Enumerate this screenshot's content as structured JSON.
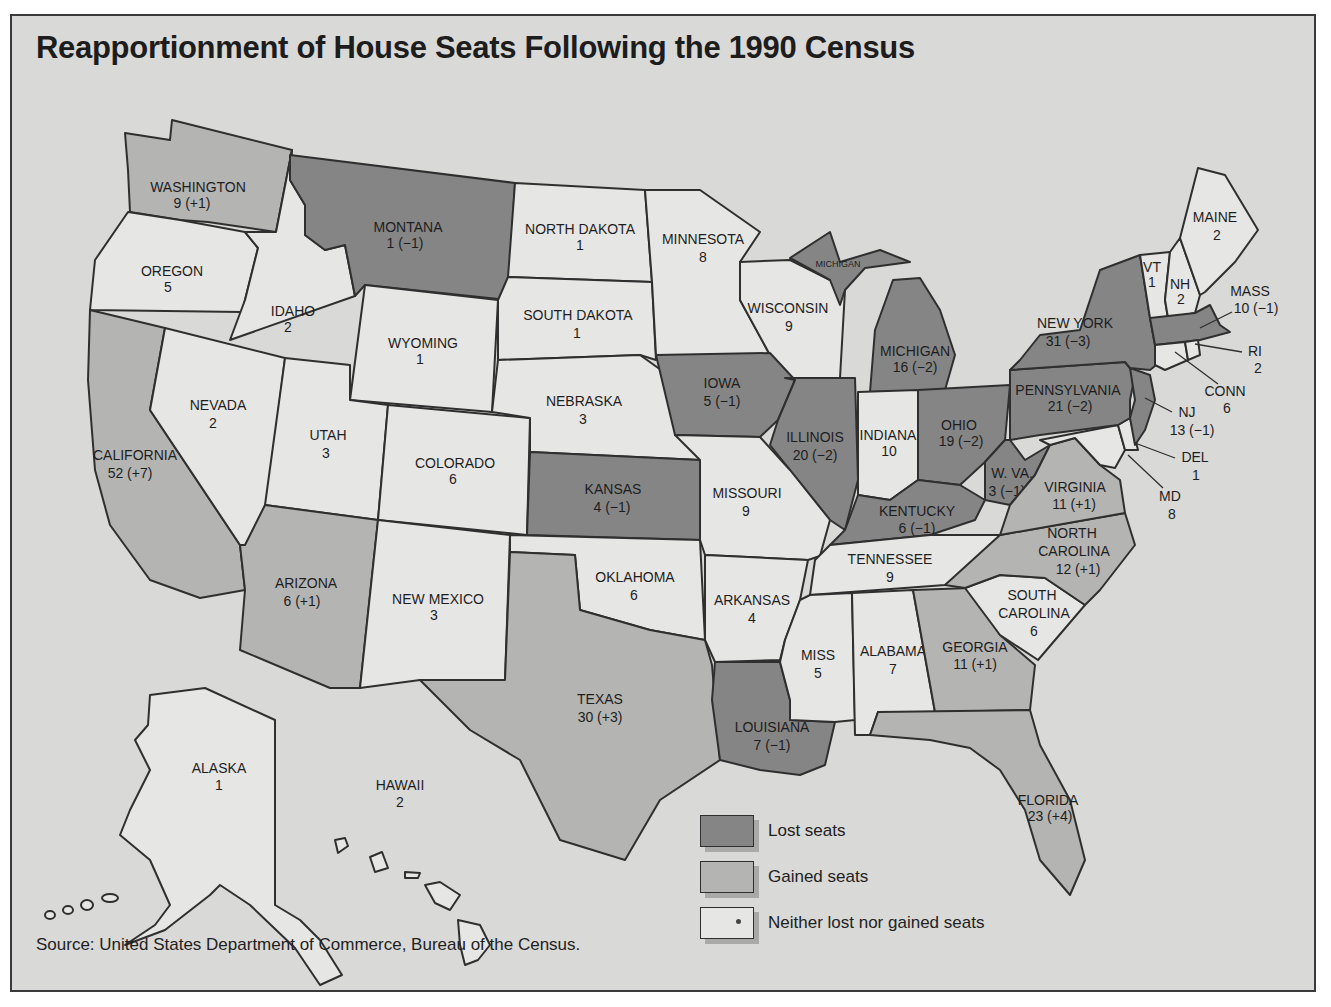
{
  "title": "Reapportionment of House Seats Following the 1990 Census",
  "source": "Source: United States Department of Commerce, Bureau of the Census.",
  "colors": {
    "lost": "#858585",
    "gained": "#b4b4b2",
    "neither": "#e6e6e4",
    "background": "#d9d9d7"
  },
  "legend": [
    {
      "key": "lost",
      "label": "Lost seats"
    },
    {
      "key": "gained",
      "label": "Gained seats"
    },
    {
      "key": "neither",
      "label": "Neither lost nor gained seats"
    }
  ],
  "states": {
    "washington": {
      "name": "WASHINGTON",
      "seats": "9 (+1)",
      "status": "gained"
    },
    "oregon": {
      "name": "OREGON",
      "seats": "5",
      "status": "neither"
    },
    "california": {
      "name": "CALIFORNIA",
      "seats": "52 (+7)",
      "status": "gained"
    },
    "idaho": {
      "name": "IDAHO",
      "seats": "2",
      "status": "neither"
    },
    "nevada": {
      "name": "NEVADA",
      "seats": "2",
      "status": "neither"
    },
    "montana": {
      "name": "MONTANA",
      "seats": "1 (−1)",
      "status": "lost"
    },
    "wyoming": {
      "name": "WYOMING",
      "seats": "1",
      "status": "neither"
    },
    "utah": {
      "name": "UTAH",
      "seats": "3",
      "status": "neither"
    },
    "arizona": {
      "name": "ARIZONA",
      "seats": "6 (+1)",
      "status": "gained"
    },
    "colorado": {
      "name": "COLORADO",
      "seats": "6",
      "status": "neither"
    },
    "new_mexico": {
      "name": "NEW MEXICO",
      "seats": "3",
      "status": "neither"
    },
    "north_dakota": {
      "name": "NORTH DAKOTA",
      "seats": "1",
      "status": "neither"
    },
    "south_dakota": {
      "name": "SOUTH DAKOTA",
      "seats": "1",
      "status": "neither"
    },
    "nebraska": {
      "name": "NEBRASKA",
      "seats": "3",
      "status": "neither"
    },
    "kansas": {
      "name": "KANSAS",
      "seats": "4 (−1)",
      "status": "lost"
    },
    "oklahoma": {
      "name": "OKLAHOMA",
      "seats": "6",
      "status": "neither"
    },
    "texas": {
      "name": "TEXAS",
      "seats": "30 (+3)",
      "status": "gained"
    },
    "minnesota": {
      "name": "MINNESOTA",
      "seats": "8",
      "status": "neither"
    },
    "iowa": {
      "name": "IOWA",
      "seats": "5 (−1)",
      "status": "lost"
    },
    "missouri": {
      "name": "MISSOURI",
      "seats": "9",
      "status": "neither"
    },
    "arkansas": {
      "name": "ARKANSAS",
      "seats": "4",
      "status": "neither"
    },
    "louisiana": {
      "name": "LOUISIANA",
      "seats": "7 (−1)",
      "status": "lost"
    },
    "wisconsin": {
      "name": "WISCONSIN",
      "seats": "9",
      "status": "neither"
    },
    "illinois": {
      "name": "ILLINOIS",
      "seats": "20 (−2)",
      "status": "lost"
    },
    "michigan": {
      "name": "MICHIGAN",
      "seats": "16 (−2)",
      "status": "lost",
      "upper_label": "MICHIGAN"
    },
    "indiana": {
      "name": "INDIANA",
      "seats": "10",
      "status": "neither"
    },
    "ohio": {
      "name": "OHIO",
      "seats": "19 (−2)",
      "status": "lost"
    },
    "kentucky": {
      "name": "KENTUCKY",
      "seats": "6 (−1)",
      "status": "lost"
    },
    "tennessee": {
      "name": "TENNESSEE",
      "seats": "9",
      "status": "neither"
    },
    "mississippi": {
      "name": "MISS",
      "seats": "5",
      "status": "neither"
    },
    "alabama": {
      "name": "ALABAMA",
      "seats": "7",
      "status": "neither"
    },
    "georgia": {
      "name": "GEORGIA",
      "seats": "11 (+1)",
      "status": "gained"
    },
    "florida": {
      "name": "FLORIDA",
      "seats": "23 (+4)",
      "status": "gained"
    },
    "south_carolina": {
      "name_line1": "SOUTH",
      "name_line2": "CAROLINA",
      "seats": "6",
      "status": "neither"
    },
    "north_carolina": {
      "name_line1": "NORTH",
      "name_line2": "CAROLINA",
      "seats": "12 (+1)",
      "status": "gained"
    },
    "virginia": {
      "name": "VIRGINIA",
      "seats": "11 (+1)",
      "status": "gained"
    },
    "west_virginia": {
      "name": "W. VA.",
      "seats": "3 (−1)",
      "status": "lost"
    },
    "pennsylvania": {
      "name": "PENNSYLVANIA",
      "seats": "21 (−2)",
      "status": "lost"
    },
    "new_york": {
      "name": "NEW YORK",
      "seats": "31 (−3)",
      "status": "lost"
    },
    "vermont": {
      "name": "VT",
      "seats": "1",
      "status": "neither"
    },
    "new_hampshire": {
      "name": "NH",
      "seats": "2",
      "status": "neither"
    },
    "maine": {
      "name": "MAINE",
      "seats": "2",
      "status": "neither"
    },
    "massachusetts": {
      "name": "MASS",
      "seats": "10 (−1)",
      "status": "lost"
    },
    "rhode_island": {
      "name": "RI",
      "seats": "2",
      "status": "neither"
    },
    "connecticut": {
      "name": "CONN",
      "seats": "6",
      "status": "neither"
    },
    "new_jersey": {
      "name": "NJ",
      "seats": "13 (−1)",
      "status": "lost"
    },
    "delaware": {
      "name": "DEL",
      "seats": "1",
      "status": "neither"
    },
    "maryland": {
      "name": "MD",
      "seats": "8",
      "status": "neither"
    },
    "alaska": {
      "name": "ALASKA",
      "seats": "1",
      "status": "neither"
    },
    "hawaii": {
      "name": "HAWAII",
      "seats": "2",
      "status": "neither"
    }
  }
}
